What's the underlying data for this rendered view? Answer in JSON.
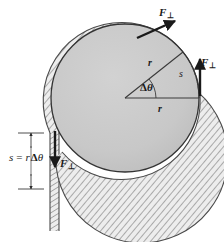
{
  "figure": {
    "colors": {
      "disk_fill": "#c9c9c9",
      "disk_stroke": "#333333",
      "rope_fill": "#e8e8e8",
      "rope_stroke": "#4a4a4a",
      "hatch_stroke": "#6e6e6e",
      "arrow_fill": "#1a1a1a",
      "line_stroke": "#3a3a3a",
      "text": "#1a1a1a",
      "background": "#ffffff"
    }
  },
  "geometry": {
    "disk_center_x": 125,
    "disk_center_y": 98,
    "disk_radius": 74,
    "rope_band_width": 7,
    "angle_delta_degrees": 38,
    "rope_vertical_x": 54,
    "rope_bottom_y": 231
  },
  "labels": {
    "force_top": {
      "symbol": "F",
      "subscript": "⊥"
    },
    "force_right": {
      "symbol": "F",
      "subscript": "⊥"
    },
    "force_bottom": {
      "symbol": "F",
      "subscript": "⊥"
    },
    "radius_upper": "r",
    "radius_lower": "r",
    "arc": "s",
    "angle": {
      "delta": "Δ",
      "theta": "θ"
    },
    "equation": {
      "lhs": "s",
      "equals": "=",
      "rhs_radius": "r",
      "rhs_delta": "Δ",
      "rhs_theta": "θ",
      "full": "s = rΔθ"
    }
  }
}
